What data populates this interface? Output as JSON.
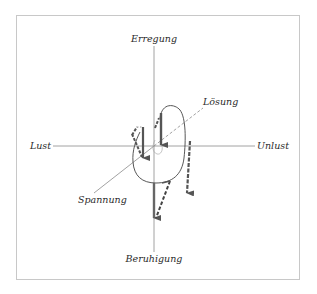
{
  "diagram": {
    "axes": {
      "top": "Erregung",
      "bottom": "Beruhigung",
      "left": "Lust",
      "right": "Unlust",
      "diagonal_upper": "Lösung",
      "diagonal_lower": "Spannung"
    },
    "colors": {
      "axis": "#8a8a8a",
      "arrow": "#555555",
      "curve": "#444444",
      "text": "#2a2a2a",
      "frame": "#c8c8c8"
    }
  }
}
